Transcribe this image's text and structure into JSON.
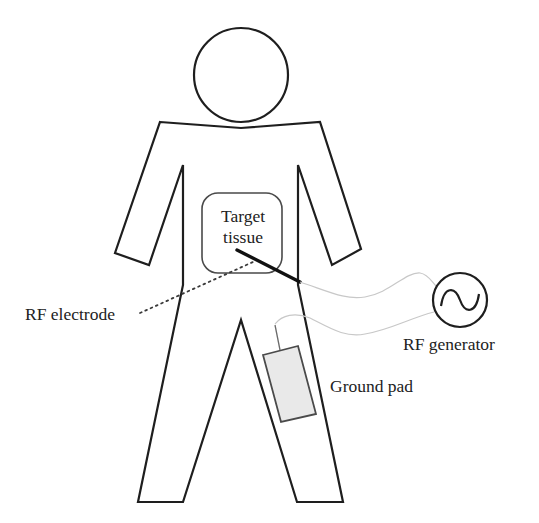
{
  "diagram": {
    "labels": {
      "target_line1": "Target",
      "target_line2": "tissue",
      "rf_electrode": "RF electrode",
      "rf_generator": "RF generator",
      "ground_pad": "Ground pad"
    },
    "icons": {
      "generator_symbol": "ac-sine-wave-icon"
    },
    "colors": {
      "outline": "#1e1e1e",
      "wire": "#c8c8c8",
      "pad_fill": "#e9e9e9",
      "background": "#ffffff"
    }
  }
}
